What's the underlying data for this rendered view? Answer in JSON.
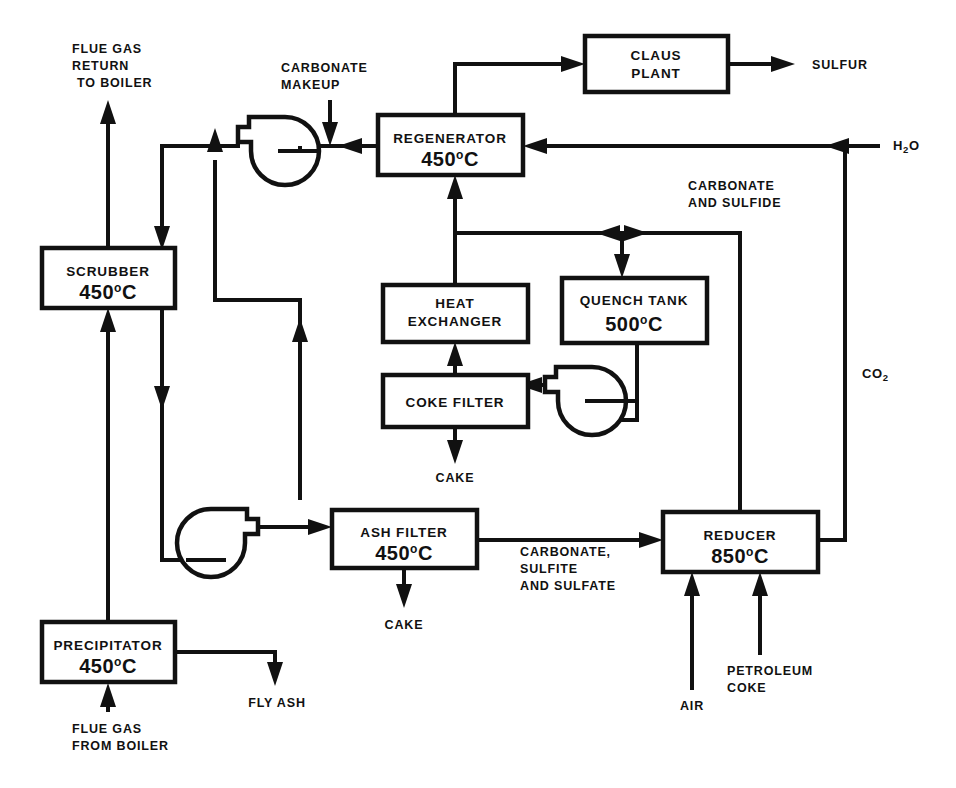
{
  "diagram": {
    "line_color": "#111111",
    "background_color": "#ffffff",
    "units": [
      {
        "id": "scrubber",
        "name": "SCRUBBER",
        "temperature": "450",
        "temp_unit": "C"
      },
      {
        "id": "precipitator",
        "name": "PRECIPITATOR",
        "temperature": "450",
        "temp_unit": "C"
      },
      {
        "id": "regenerator",
        "name": "REGENERATOR",
        "temperature": "450",
        "temp_unit": "C"
      },
      {
        "id": "claus-plant",
        "name_line1": "CLAUS",
        "name_line2": "PLANT",
        "temperature": "",
        "temp_unit": ""
      },
      {
        "id": "heat-exchanger",
        "name_line1": "HEAT",
        "name_line2": "EXCHANGER",
        "temperature": "",
        "temp_unit": ""
      },
      {
        "id": "quench-tank",
        "name": "QUENCH TANK",
        "temperature": "500",
        "temp_unit": "C"
      },
      {
        "id": "coke-filter",
        "name": "COKE  FILTER",
        "temperature": "",
        "temp_unit": ""
      },
      {
        "id": "ash-filter",
        "name": "ASH FILTER",
        "temperature": "450",
        "temp_unit": "C"
      },
      {
        "id": "reducer",
        "name": "REDUCER",
        "temperature": "850",
        "temp_unit": "C"
      }
    ],
    "stream_labels": {
      "flue_gas_return": {
        "line1": "FLUE GAS",
        "line2": "RETURN",
        "line3": "TO BOILER"
      },
      "carbonate_makeup": {
        "line1": "CARBONATE",
        "line2": "MAKEUP"
      },
      "sulfur": "SULFUR",
      "water": {
        "formula": "H",
        "sub1": "2",
        "rest": "O"
      },
      "carbonate_and_sulfide": {
        "line1": "CARBONATE",
        "line2": "AND SULFIDE"
      },
      "carbon_dioxide": {
        "formula": "CO",
        "sub1": "2"
      },
      "coke_filter_cake": "CAKE",
      "ash_filter_cake": "CAKE",
      "carbonate_sulfite_sulfate": {
        "line1": "CARBONATE,",
        "line2": "SULFITE",
        "line3": "AND SULFATE"
      },
      "air": "AIR",
      "petroleum_coke": {
        "line1": "PETROLEUM",
        "line2": "COKE"
      },
      "fly_ash": "FLY ASH",
      "flue_gas_from_boiler": {
        "line1": "FLUE GAS",
        "line2": "FROM BOILER"
      }
    },
    "equipment_symbols": [
      {
        "id": "pump-regenerator-outlet",
        "type": "centrifugal-blower"
      },
      {
        "id": "pump-coke-filter-feed",
        "type": "centrifugal-blower"
      },
      {
        "id": "pump-ash-filter-feed",
        "type": "centrifugal-blower"
      }
    ]
  }
}
